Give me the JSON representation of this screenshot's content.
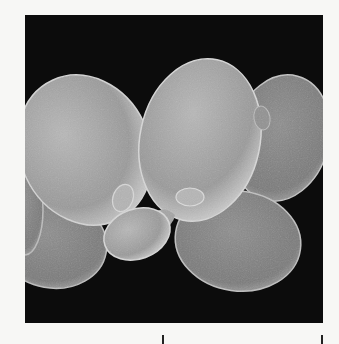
{
  "figure": {
    "background_color": "#0c0c0c",
    "page_color": "#f7f7f5",
    "cell_color": "#a8a8a8",
    "cells": [
      {
        "id": "left-mother",
        "cx": 60,
        "cy": 135,
        "rx": 65,
        "ry": 77,
        "rot": -25
      },
      {
        "id": "left-lower-partial",
        "cx": 27,
        "cy": 228,
        "rx": 55,
        "ry": 45,
        "rot": 10
      },
      {
        "id": "left-edge-partial",
        "cx": 0,
        "cy": 195,
        "rx": 18,
        "ry": 45,
        "rot": 0
      },
      {
        "id": "right-back",
        "cx": 256,
        "cy": 123,
        "rx": 48,
        "ry": 64,
        "rot": 15
      },
      {
        "id": "center-mother",
        "cx": 175,
        "cy": 125,
        "rx": 60,
        "ry": 82,
        "rot": 12
      },
      {
        "id": "lower-right",
        "cx": 213,
        "cy": 226,
        "rx": 63,
        "ry": 50,
        "rot": 8
      },
      {
        "id": "small-bud",
        "cx": 112,
        "cy": 219,
        "rx": 34,
        "ry": 25,
        "rot": -20
      }
    ],
    "scale_bar": {
      "ticks_x": [
        162,
        322
      ],
      "label": ""
    }
  }
}
